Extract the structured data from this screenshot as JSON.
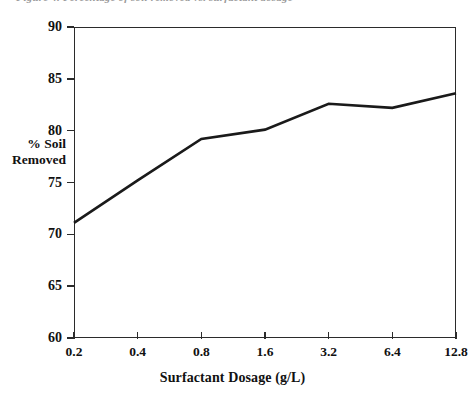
{
  "caption": "Figure 4. Percentage of soil removed vs. surfactant dosage",
  "chart_data": {
    "type": "line",
    "title": "",
    "xlabel": "Surfactant Dosage (g/L)",
    "ylabel": "% Soil\nRemoved",
    "ylabel_lines": [
      "% Soil",
      "Removed"
    ],
    "categories": [
      "0.2",
      "0.4",
      "0.8",
      "1.6",
      "3.2",
      "6.4",
      "12.8"
    ],
    "values": [
      71.1,
      75.2,
      79.2,
      80.1,
      82.6,
      82.2,
      83.6
    ],
    "series": [
      {
        "name": "% Soil Removed",
        "values": [
          71.1,
          75.2,
          79.2,
          80.1,
          82.6,
          82.2,
          83.6
        ]
      }
    ],
    "ylim": [
      60,
      90
    ],
    "yticks": [
      60,
      65,
      70,
      75,
      80,
      85,
      90
    ],
    "ytick_labels": [
      "60",
      "65",
      "70",
      "75",
      "80",
      "85",
      "90"
    ],
    "xtick_labels": [
      "0.2",
      "0.4",
      "0.8",
      "1.6",
      "3.2",
      "6.4",
      "12.8"
    ],
    "grid": false,
    "legend": false,
    "legend_position": "none",
    "line_color": "#1a1a1a",
    "axis_color": "#2b2b2b",
    "background_color": "#ffffff",
    "marker": "none"
  }
}
